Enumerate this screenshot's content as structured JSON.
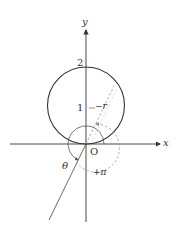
{
  "diagram": {
    "axes": {
      "x_label": "x",
      "y_label": "y",
      "origin_label": "O"
    },
    "tick_labels": {
      "y_2": "2",
      "y_1": "1"
    },
    "annotations": {
      "minus_r": "−r",
      "theta": "θ",
      "plus_pi": "+π"
    },
    "shapes": [
      {
        "type": "circle",
        "center": [
          0,
          1
        ],
        "radius": 1,
        "style": "solid"
      },
      {
        "type": "arc",
        "center": [
          0,
          0
        ],
        "style": "solid",
        "label": "θ"
      },
      {
        "type": "arc",
        "center": [
          0,
          0
        ],
        "style": "dashed",
        "label": "+π"
      },
      {
        "type": "ray",
        "from": [
          0,
          0
        ],
        "direction": "lower-left",
        "style": "solid"
      },
      {
        "type": "ray",
        "from": [
          0,
          0
        ],
        "direction": "upper-right",
        "style": "dashed"
      }
    ],
    "colors": {
      "axis": "#333333",
      "circle": "#333333",
      "dashed": "#999999"
    }
  }
}
